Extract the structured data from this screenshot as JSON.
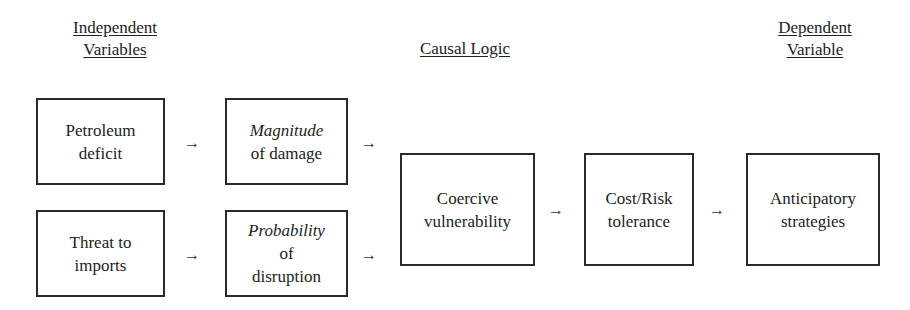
{
  "headers": {
    "independent": [
      "Independent",
      "Variables"
    ],
    "causal": "Causal Logic",
    "dependent": [
      "Dependent",
      "Variable"
    ]
  },
  "boxes": {
    "petroleum": [
      "Petroleum",
      "deficit"
    ],
    "threat": [
      "Threat to",
      "imports"
    ],
    "magnitude": {
      "italic": "Magnitude",
      "rest": "of damage"
    },
    "probability": {
      "italic": "Probability",
      "rest": [
        "of",
        "disruption"
      ]
    },
    "coercive": [
      "Coercive",
      "vulnerability"
    ],
    "costrisk": [
      "Cost/Risk",
      "tolerance"
    ],
    "anticipatory": [
      "Anticipatory",
      "strategies"
    ]
  },
  "arrow_glyph": "→"
}
